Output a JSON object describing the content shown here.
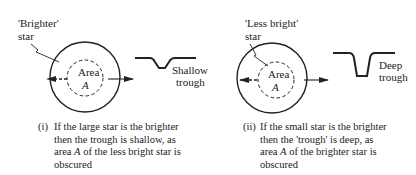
{
  "panels": [
    {
      "star_label_line1": "'Brighter'",
      "star_label_line2": "star",
      "area_label": "Area",
      "area_symbol": "A",
      "trough_label_line1": "Shallow",
      "trough_label_line2": "trough",
      "trough_depth": "shallow",
      "caption_number": "(i)",
      "caption_lines": [
        "If the large star is the brighter",
        "then the trough is shallow, as",
        "area A of the less bright star is",
        "obscured"
      ]
    },
    {
      "star_label_line1": "'Less bright'",
      "star_label_line2": "star",
      "area_label": "Area",
      "area_symbol": "A",
      "trough_label_line1": "Deep",
      "trough_label_line2": "trough",
      "trough_depth": "deep",
      "caption_number": "(ii)",
      "caption_lines": [
        "If the small star is the brighter",
        "then the 'trough' is deep, as",
        "area A of the brighter star is",
        "obscured"
      ]
    }
  ],
  "colors": {
    "ink": "#222222",
    "background": "#ffffff"
  }
}
